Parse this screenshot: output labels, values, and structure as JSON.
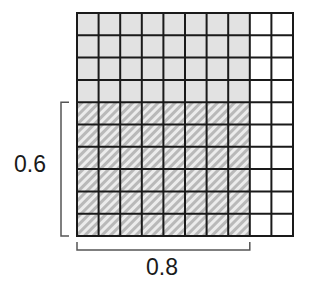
{
  "diagram": {
    "type": "decimal-multiplication-area-model",
    "grid": {
      "rows": 10,
      "cols": 10,
      "shaded_cols": 8,
      "hatched_rows": 6,
      "x": 77,
      "y": 13,
      "width": 216,
      "height": 223
    },
    "labels": {
      "vertical_bracket": "0.6",
      "horizontal_bracket": "0.8"
    },
    "colors": {
      "grid_line": "#1a1a1a",
      "shaded_fill": "#e2e2e2",
      "hatch_base": "#b9b9b9",
      "hatch_stripe": "#ececec",
      "unshaded_fill": "#ffffff",
      "bracket": "#555555"
    }
  }
}
